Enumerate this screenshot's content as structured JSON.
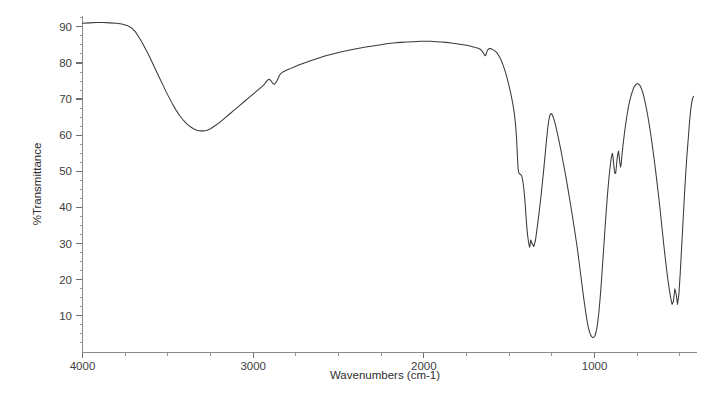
{
  "chart_data": {
    "type": "line",
    "title": "",
    "subtitle": "",
    "xlabel": "Wavenumbers (cm-1)",
    "ylabel": "%Transmittance",
    "xlim": [
      4000,
      400
    ],
    "ylim": [
      0,
      93
    ],
    "x_axis_reversed": true,
    "grid": false,
    "legend": null,
    "legend_position": "none",
    "x_major_ticks": [
      4000,
      3000,
      2000,
      1000
    ],
    "x_major_tick_labels": [
      "4000",
      "3000",
      "2000",
      "1000"
    ],
    "x_minor_tick_interval": 250,
    "y_major_ticks": [
      10,
      20,
      30,
      40,
      50,
      60,
      70,
      80,
      90
    ],
    "y_major_tick_labels": [
      "10",
      "20",
      "30",
      "40",
      "50",
      "60",
      "70",
      "80",
      "90"
    ],
    "y_minor_tick_interval": 2.5,
    "series": [
      {
        "name": "FTIR transmittance spectrum",
        "color": "#3a3a3a",
        "x": [
          4000,
          3960,
          3920,
          3880,
          3840,
          3800,
          3770,
          3740,
          3710,
          3690,
          3670,
          3650,
          3630,
          3610,
          3590,
          3570,
          3550,
          3530,
          3510,
          3490,
          3470,
          3450,
          3430,
          3410,
          3390,
          3370,
          3350,
          3330,
          3310,
          3290,
          3270,
          3250,
          3230,
          3200,
          3170,
          3140,
          3110,
          3080,
          3050,
          3020,
          2990,
          2970,
          2955,
          2940,
          2930,
          2922,
          2915,
          2905,
          2895,
          2885,
          2875,
          2865,
          2855,
          2848,
          2840,
          2830,
          2815,
          2800,
          2780,
          2760,
          2730,
          2700,
          2660,
          2620,
          2580,
          2540,
          2500,
          2460,
          2420,
          2380,
          2340,
          2300,
          2260,
          2220,
          2180,
          2140,
          2100,
          2060,
          2020,
          1990,
          1960,
          1930,
          1900,
          1870,
          1840,
          1810,
          1780,
          1750,
          1730,
          1715,
          1700,
          1690,
          1680,
          1670,
          1662,
          1655,
          1648,
          1642,
          1637,
          1632,
          1626,
          1620,
          1612,
          1604,
          1596,
          1586,
          1576,
          1566,
          1556,
          1546,
          1536,
          1526,
          1516,
          1506,
          1496,
          1486,
          1478,
          1470,
          1463,
          1457,
          1452,
          1448,
          1444,
          1440,
          1436,
          1432,
          1428,
          1424,
          1420,
          1416,
          1412,
          1408,
          1404,
          1400,
          1396,
          1392,
          1388,
          1384,
          1380,
          1374,
          1366,
          1356,
          1346,
          1336,
          1324,
          1312,
          1300,
          1290,
          1282,
          1275,
          1268,
          1262,
          1256,
          1250,
          1242,
          1232,
          1222,
          1210,
          1198,
          1186,
          1174,
          1162,
          1150,
          1138,
          1126,
          1114,
          1102,
          1092,
          1082,
          1072,
          1064,
          1058,
          1052,
          1046,
          1040,
          1034,
          1028,
          1022,
          1016,
          1010,
          1004,
          998,
          992,
          986,
          980,
          974,
          968,
          962,
          956,
          950,
          944,
          938,
          932,
          926,
          920,
          914,
          908,
          902,
          896,
          892,
          888,
          884,
          880,
          876,
          872,
          868,
          864,
          860,
          856,
          852,
          848,
          844,
          840,
          834,
          826,
          818,
          810,
          802,
          794,
          786,
          778,
          770,
          762,
          754,
          746,
          738,
          730,
          722,
          714,
          706,
          698,
          690,
          682,
          674,
          666,
          658,
          650,
          642,
          634,
          626,
          618,
          610,
          602,
          594,
          586,
          578,
          570,
          562,
          554,
          546,
          538,
          530,
          522,
          514,
          506,
          498,
          490,
          482,
          474,
          466,
          458,
          450,
          444,
          438,
          432,
          426,
          420
        ],
        "y": [
          91.0,
          91.1,
          91.2,
          91.2,
          91.1,
          91.0,
          90.8,
          90.4,
          89.6,
          88.6,
          87.2,
          85.6,
          83.8,
          82.0,
          80.0,
          78.0,
          76.0,
          74.0,
          72.0,
          70.2,
          68.4,
          66.8,
          65.4,
          64.2,
          63.2,
          62.4,
          61.8,
          61.4,
          61.2,
          61.2,
          61.4,
          61.8,
          62.4,
          63.4,
          64.6,
          65.8,
          67.0,
          68.2,
          69.4,
          70.6,
          71.8,
          72.6,
          73.2,
          73.8,
          74.4,
          74.9,
          75.3,
          75.5,
          75.0,
          74.3,
          74.1,
          74.7,
          75.6,
          76.4,
          77.0,
          77.4,
          77.8,
          78.1,
          78.5,
          78.9,
          79.5,
          80.0,
          80.7,
          81.3,
          81.9,
          82.4,
          82.9,
          83.3,
          83.7,
          84.1,
          84.4,
          84.7,
          85.0,
          85.3,
          85.5,
          85.7,
          85.8,
          85.9,
          86.0,
          86.0,
          86.0,
          85.9,
          85.8,
          85.7,
          85.5,
          85.3,
          85.1,
          84.9,
          84.7,
          84.5,
          84.3,
          84.2,
          84.0,
          83.8,
          83.5,
          83.0,
          82.5,
          82.0,
          82.2,
          83.0,
          83.6,
          83.9,
          84.0,
          83.9,
          83.7,
          83.4,
          83.0,
          82.4,
          81.6,
          80.6,
          79.4,
          78.0,
          76.4,
          74.6,
          72.6,
          70.4,
          68.4,
          66.0,
          63.0,
          59.0,
          54.0,
          50.8,
          49.6,
          49.3,
          49.2,
          49.1,
          48.8,
          48.2,
          47.2,
          45.8,
          44.0,
          41.8,
          39.2,
          36.4,
          34.0,
          32.2,
          30.8,
          29.6,
          29.0,
          31.0,
          30.0,
          29.2,
          31.0,
          34.5,
          39.0,
          44.0,
          49.5,
          54.5,
          58.5,
          61.8,
          64.2,
          65.5,
          66.0,
          65.8,
          65.0,
          63.4,
          61.4,
          58.8,
          56.0,
          53.0,
          50.0,
          46.8,
          43.4,
          40.0,
          36.4,
          32.8,
          29.0,
          25.4,
          21.6,
          18.0,
          15.0,
          13.0,
          11.0,
          9.2,
          7.6,
          6.3,
          5.3,
          4.6,
          4.2,
          4.0,
          4.1,
          4.5,
          5.4,
          6.8,
          8.8,
          11.4,
          14.6,
          18.2,
          22.2,
          26.4,
          30.6,
          34.8,
          38.8,
          42.6,
          46.0,
          49.0,
          51.6,
          53.8,
          55.0,
          54.0,
          52.0,
          50.2,
          49.4,
          49.6,
          51.4,
          53.4,
          54.8,
          55.6,
          54.2,
          52.4,
          51.2,
          52.0,
          54.4,
          57.0,
          60.2,
          63.0,
          65.6,
          67.8,
          69.6,
          71.0,
          72.2,
          73.2,
          73.8,
          74.2,
          74.3,
          74.0,
          73.4,
          72.4,
          71.2,
          69.6,
          67.8,
          65.8,
          63.6,
          61.2,
          58.6,
          55.8,
          53.0,
          50.0,
          46.8,
          43.6,
          40.2,
          36.6,
          33.0,
          29.4,
          26.0,
          22.8,
          19.8,
          17.2,
          15.0,
          13.2,
          14.0,
          17.5,
          16.0,
          13.2,
          16.0,
          22.0,
          29.0,
          36.0,
          43.0,
          49.5,
          55.0,
          59.8,
          63.6,
          66.6,
          68.8,
          70.2,
          70.8
        ],
        "annotations": [
          {
            "label": "O-H stretch broad minimum",
            "x": 3310,
            "y": 61.2
          },
          {
            "label": "C-H stretch",
            "x": 2920,
            "y": 74.9
          },
          {
            "label": "C-H stretch",
            "x": 2850,
            "y": 74.1
          },
          {
            "label": "H-O-H bend",
            "x": 1648,
            "y": 82.0
          },
          {
            "label": "carbonate / C-H bend",
            "x": 1418,
            "y": 29.0
          },
          {
            "label": "shoulder",
            "x": 1500,
            "y": 49.2
          },
          {
            "label": "local maximum",
            "x": 1262,
            "y": 66.0
          },
          {
            "label": "Si-O / C-O strong minimum",
            "x": 1040,
            "y": 4.0
          },
          {
            "label": "local maximum",
            "x": 900,
            "y": 55.0
          },
          {
            "label": "local maximum",
            "x": 798,
            "y": 74.3
          },
          {
            "label": "minimum",
            "x": 540,
            "y": 13.2
          },
          {
            "label": "minimum",
            "x": 500,
            "y": 13.2
          }
        ]
      }
    ]
  },
  "axes": {
    "y_label_text": "%Transmittance",
    "x_label_text": "Wavenumbers (cm-1)"
  },
  "colors": {
    "trace": "#3a3a3a",
    "axis": "#8a8a8a",
    "tick": "#6e6e6e",
    "text": "#2e2e2e",
    "background": "#ffffff"
  }
}
